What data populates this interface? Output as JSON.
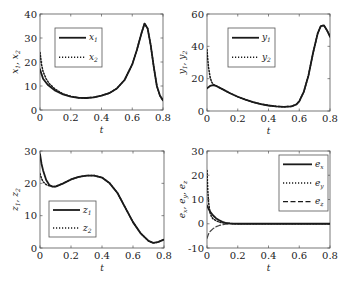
{
  "chart_data": [
    {
      "type": "line",
      "id": "xplot",
      "title": "",
      "xlabel": "t",
      "ylabel": "x1, x2",
      "xlim": [
        0,
        0.8
      ],
      "ylim": [
        0,
        40
      ],
      "xticks": [
        0,
        0.2,
        0.4,
        0.6,
        0.8
      ],
      "xtick_labels": [
        "0",
        "0.2",
        "0.4",
        "0.6",
        "0.8"
      ],
      "yticks": [
        0,
        10,
        20,
        30,
        40
      ],
      "ytick_labels": [
        "0",
        "10",
        "20",
        "30",
        "40"
      ],
      "grid": false,
      "legend": "top-left",
      "series": [
        {
          "name": "x1",
          "label_main": "x",
          "label_sub": "1",
          "style": "solid",
          "x": [
            0,
            0.02,
            0.05,
            0.1,
            0.15,
            0.2,
            0.25,
            0.3,
            0.35,
            0.4,
            0.45,
            0.5,
            0.55,
            0.6,
            0.63,
            0.66,
            0.68,
            0.7,
            0.72,
            0.74,
            0.76,
            0.78,
            0.8
          ],
          "y": [
            17,
            13,
            10.5,
            8,
            6.5,
            5.6,
            5.1,
            5,
            5.3,
            6,
            7,
            9,
            12.5,
            19,
            25,
            32,
            36,
            34,
            27,
            18,
            10,
            6,
            4
          ]
        },
        {
          "name": "x2",
          "label_main": "x",
          "label_sub": "2",
          "style": "dotted",
          "x": [
            0,
            0.01,
            0.02,
            0.04,
            0.06,
            0.1,
            0.15,
            0.2,
            0.25,
            0.3,
            0.35,
            0.4,
            0.45,
            0.5,
            0.55,
            0.6,
            0.63,
            0.66,
            0.68,
            0.7,
            0.72,
            0.74,
            0.76,
            0.78,
            0.8
          ],
          "y": [
            24,
            19,
            16,
            13,
            11,
            8.6,
            6.7,
            5.7,
            5.1,
            5,
            5.3,
            6,
            7,
            9,
            12.5,
            19,
            25,
            32,
            36,
            34,
            27,
            18,
            10,
            6,
            4
          ]
        }
      ]
    },
    {
      "type": "line",
      "id": "yplot",
      "title": "",
      "xlabel": "t",
      "ylabel": "y1, y2",
      "xlim": [
        0,
        0.8
      ],
      "ylim": [
        0,
        60
      ],
      "xticks": [
        0,
        0.2,
        0.4,
        0.6,
        0.8
      ],
      "xtick_labels": [
        "0",
        "0.2",
        "0.4",
        "0.6",
        "0.8"
      ],
      "yticks": [
        0,
        20,
        40,
        60
      ],
      "ytick_labels": [
        "0",
        "20",
        "40",
        "60"
      ],
      "grid": false,
      "legend": "top-left",
      "series": [
        {
          "name": "y1",
          "label_main": "y",
          "label_sub": "1",
          "style": "solid",
          "x": [
            0,
            0.02,
            0.04,
            0.06,
            0.1,
            0.15,
            0.2,
            0.25,
            0.3,
            0.35,
            0.4,
            0.45,
            0.5,
            0.55,
            0.58,
            0.6,
            0.63,
            0.66,
            0.69,
            0.72,
            0.74,
            0.76,
            0.78,
            0.8
          ],
          "y": [
            14,
            15.5,
            16,
            15.5,
            13.5,
            11,
            8.8,
            7,
            5.5,
            4.3,
            3.4,
            2.8,
            2.6,
            2.9,
            4,
            6,
            12,
            22,
            36,
            48,
            52.5,
            53,
            50,
            46
          ]
        },
        {
          "name": "y2",
          "label_main": "y",
          "label_sub": "2",
          "style": "dotted",
          "x": [
            0,
            0.005,
            0.01,
            0.02,
            0.03,
            0.04,
            0.06,
            0.1,
            0.15,
            0.2,
            0.25,
            0.3,
            0.35,
            0.4,
            0.45,
            0.5,
            0.55,
            0.58,
            0.6,
            0.63,
            0.66,
            0.69,
            0.72,
            0.74,
            0.76,
            0.78,
            0.8
          ],
          "y": [
            38,
            32,
            27,
            21,
            18,
            16.5,
            15.5,
            13.5,
            11,
            8.8,
            7,
            5.5,
            4.3,
            3.4,
            2.8,
            2.6,
            2.9,
            4,
            6,
            12,
            22,
            36,
            48,
            52.5,
            53,
            50,
            46
          ]
        }
      ]
    },
    {
      "type": "line",
      "id": "zplot",
      "title": "",
      "xlabel": "t",
      "ylabel": "z1, z2",
      "xlim": [
        0,
        0.8
      ],
      "ylim": [
        0,
        30
      ],
      "xticks": [
        0,
        0.2,
        0.4,
        0.6,
        0.8
      ],
      "xtick_labels": [
        "0",
        "0.2",
        "0.4",
        "0.6",
        "0.8"
      ],
      "yticks": [
        0,
        10,
        20,
        30
      ],
      "ytick_labels": [
        "0",
        "10",
        "20",
        "30"
      ],
      "grid": false,
      "legend": "bottom-left",
      "series": [
        {
          "name": "z1",
          "label_main": "z",
          "label_sub": "1",
          "style": "solid",
          "x": [
            0,
            0.01,
            0.02,
            0.04,
            0.06,
            0.08,
            0.1,
            0.15,
            0.2,
            0.25,
            0.3,
            0.35,
            0.4,
            0.45,
            0.5,
            0.55,
            0.6,
            0.65,
            0.7,
            0.73,
            0.76,
            0.8
          ],
          "y": [
            29,
            26,
            24,
            21,
            19.5,
            19,
            19,
            20,
            21.2,
            22,
            22.4,
            22.4,
            21.8,
            20,
            17,
            12.5,
            8,
            4.5,
            2.2,
            1.6,
            1.8,
            2.6
          ]
        },
        {
          "name": "z2",
          "label_main": "z",
          "label_sub": "2",
          "style": "dotted",
          "x": [
            0,
            0.01,
            0.02,
            0.04,
            0.06,
            0.08,
            0.1,
            0.15,
            0.2,
            0.25,
            0.3,
            0.35,
            0.4,
            0.45,
            0.5,
            0.55,
            0.6,
            0.65,
            0.7,
            0.73,
            0.76,
            0.8
          ],
          "y": [
            23,
            21.5,
            20.5,
            19.6,
            19.2,
            19,
            19,
            20,
            21.2,
            22,
            22.4,
            22.4,
            21.8,
            20,
            17,
            12.5,
            8,
            4.5,
            2.2,
            1.6,
            1.8,
            2.6
          ]
        }
      ]
    },
    {
      "type": "line",
      "id": "eplot",
      "title": "",
      "xlabel": "t",
      "ylabel": "ex, ey, ez",
      "xlim": [
        0,
        0.8
      ],
      "ylim": [
        -10,
        30
      ],
      "xticks": [
        0,
        0.2,
        0.4,
        0.6,
        0.8
      ],
      "xtick_labels": [
        "0",
        "0.2",
        "0.4",
        "0.6",
        "0.8"
      ],
      "yticks": [
        -10,
        0,
        10,
        20,
        30
      ],
      "ytick_labels": [
        "-10",
        "0",
        "10",
        "20",
        "30"
      ],
      "grid": false,
      "legend": "top-right",
      "series": [
        {
          "name": "ex",
          "label_main": "e",
          "label_sub": "x",
          "style": "solid",
          "x": [
            0,
            0.01,
            0.02,
            0.04,
            0.06,
            0.08,
            0.1,
            0.12,
            0.15,
            0.2,
            0.3,
            0.5,
            0.8
          ],
          "y": [
            7.5,
            6.2,
            5,
            3.4,
            2.2,
            1.4,
            0.8,
            0.4,
            0.15,
            0,
            0,
            0,
            0
          ]
        },
        {
          "name": "ey",
          "label_main": "e",
          "label_sub": "y",
          "style": "dotted",
          "x": [
            0,
            0.005,
            0.01,
            0.02,
            0.03,
            0.04,
            0.06,
            0.08,
            0.1,
            0.12,
            0.15,
            0.2,
            0.3,
            0.5,
            0.8
          ],
          "y": [
            22,
            14,
            9,
            4.5,
            2.8,
            2,
            1.2,
            0.7,
            0.4,
            0.2,
            0.08,
            0,
            0,
            0,
            0
          ]
        },
        {
          "name": "ez",
          "label_main": "e",
          "label_sub": "z",
          "style": "dashed",
          "x": [
            0,
            0.01,
            0.02,
            0.04,
            0.06,
            0.08,
            0.1,
            0.12,
            0.15,
            0.2,
            0.3,
            0.5,
            0.8
          ],
          "y": [
            -6,
            -4.2,
            -3.2,
            -2,
            -1.2,
            -0.7,
            -0.4,
            -0.2,
            -0.05,
            0,
            0,
            0,
            0
          ]
        }
      ]
    }
  ]
}
